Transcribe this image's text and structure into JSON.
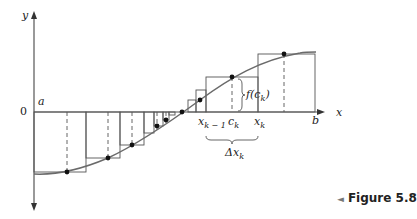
{
  "figure": {
    "caption": "Figure 5.8",
    "caption_marker": "◄",
    "axes": {
      "x_label": "x",
      "y_label": "y",
      "origin_label": "0",
      "a_label": "a",
      "b_label": "b"
    },
    "annotations": {
      "x_k_minus_1": "x",
      "x_k_minus_1_sub": "k − 1",
      "c_k": "c",
      "c_k_sub": "k",
      "x_k": "x",
      "x_k_sub": "k",
      "f_c_k_prefix": "f(c",
      "f_c_k_sub": "k",
      "f_c_k_suffix": ")",
      "delta_x_k": "Δx",
      "delta_x_k_sub": "k"
    },
    "colors": {
      "curve": "#6a6a6a",
      "axes": "#555555",
      "rect": "#555555",
      "dash": "#555555",
      "point": "#111111"
    }
  }
}
